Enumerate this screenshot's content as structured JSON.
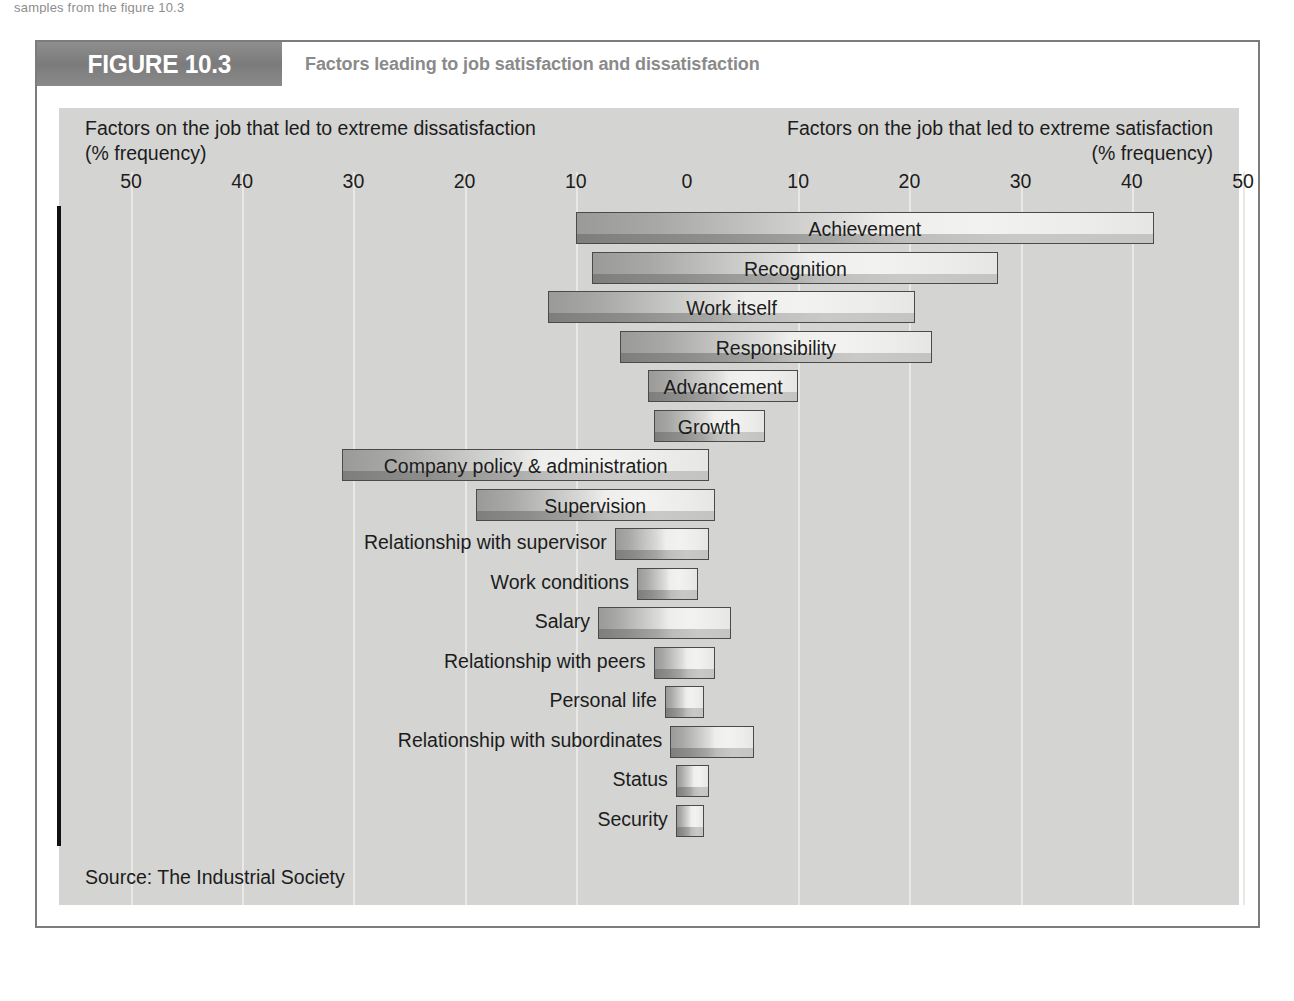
{
  "page": {
    "top_cut_text": "samples from the figure 10.3"
  },
  "figure": {
    "tag": "FIGURE 10.3",
    "title": "Factors leading to job satisfaction and dissatisfaction",
    "source": "Source: The Industrial Society"
  },
  "axis": {
    "heading_left_line1": "Factors on the job that led to extreme dissatisfaction",
    "heading_left_line2": "(% frequency)",
    "heading_right_line1": "Factors on the job that led to extreme satisfaction",
    "heading_right_line2": "(% frequency)",
    "ticks": [
      "50",
      "40",
      "30",
      "20",
      "10",
      "0",
      "10",
      "20",
      "30",
      "40",
      "50"
    ],
    "tick_values": [
      -50,
      -40,
      -30,
      -20,
      -10,
      0,
      10,
      20,
      30,
      40,
      50
    ]
  },
  "colors": {
    "panel_background": "#d4d4d2",
    "gridline": "#e8e8e6",
    "axis_line": "#111111",
    "bar_border": "#4a4a4a",
    "bar_dark": "#8d8d8b",
    "bar_light": "#f0f0ee",
    "header_band": "#7b7b7b",
    "title_text": "#8a8a8a",
    "frame_border": "#7c7c7c"
  },
  "chart_data": {
    "type": "bar",
    "orientation": "horizontal-diverging",
    "title": "Factors leading to job satisfaction and dissatisfaction",
    "xlabel": "% frequency",
    "ylabel": "",
    "xlim": [
      -50,
      50
    ],
    "grid": true,
    "legend": "none",
    "source": "The Industrial Society",
    "left_axis_label": "Factors on the job that led to extreme dissatisfaction (% frequency)",
    "right_axis_label": "Factors on the job that led to extreme satisfaction (% frequency)",
    "categories": [
      "Achievement",
      "Recognition",
      "Work itself",
      "Responsibility",
      "Advancement",
      "Growth",
      "Company policy & administration",
      "Supervision",
      "Relationship with supervisor",
      "Work conditions",
      "Salary",
      "Relationship with peers",
      "Personal life",
      "Relationship with subordinates",
      "Status",
      "Security"
    ],
    "series": [
      {
        "name": "Factors on the job that led to extreme dissatisfaction (% frequency)",
        "values": [
          10,
          8.5,
          12.5,
          6,
          3.5,
          3,
          31,
          19,
          6.5,
          4.5,
          8,
          3,
          2,
          1.5,
          1,
          1
        ]
      },
      {
        "name": "Factors on the job that led to extreme satisfaction (% frequency)",
        "values": [
          42,
          28,
          20.5,
          22,
          10,
          7,
          2,
          2.5,
          2,
          1,
          4,
          2.5,
          1.5,
          6,
          2,
          1.5
        ]
      }
    ],
    "bars": [
      {
        "label": "Achievement",
        "dissatisfaction": 10,
        "satisfaction": 42,
        "label_position": "inside"
      },
      {
        "label": "Recognition",
        "dissatisfaction": 8.5,
        "satisfaction": 28,
        "label_position": "inside"
      },
      {
        "label": "Work itself",
        "dissatisfaction": 12.5,
        "satisfaction": 20.5,
        "label_position": "inside"
      },
      {
        "label": "Responsibility",
        "dissatisfaction": 6,
        "satisfaction": 22,
        "label_position": "inside"
      },
      {
        "label": "Advancement",
        "dissatisfaction": 3.5,
        "satisfaction": 10,
        "label_position": "inside"
      },
      {
        "label": "Growth",
        "dissatisfaction": 3,
        "satisfaction": 7,
        "label_position": "inside"
      },
      {
        "label": "Company policy & administration",
        "dissatisfaction": 31,
        "satisfaction": 2,
        "label_position": "inside"
      },
      {
        "label": "Supervision",
        "dissatisfaction": 19,
        "satisfaction": 2.5,
        "label_position": "inside"
      },
      {
        "label": "Relationship with supervisor",
        "dissatisfaction": 6.5,
        "satisfaction": 2,
        "label_position": "outside"
      },
      {
        "label": "Work conditions",
        "dissatisfaction": 4.5,
        "satisfaction": 1,
        "label_position": "outside"
      },
      {
        "label": "Salary",
        "dissatisfaction": 8,
        "satisfaction": 4,
        "label_position": "outside"
      },
      {
        "label": "Relationship with peers",
        "dissatisfaction": 3,
        "satisfaction": 2.5,
        "label_position": "outside"
      },
      {
        "label": "Personal life",
        "dissatisfaction": 2,
        "satisfaction": 1.5,
        "label_position": "outside"
      },
      {
        "label": "Relationship with subordinates",
        "dissatisfaction": 1.5,
        "satisfaction": 6,
        "label_position": "outside"
      },
      {
        "label": "Status",
        "dissatisfaction": 1,
        "satisfaction": 2,
        "label_position": "outside"
      },
      {
        "label": "Security",
        "dissatisfaction": 1,
        "satisfaction": 1.5,
        "label_position": "outside"
      }
    ]
  }
}
